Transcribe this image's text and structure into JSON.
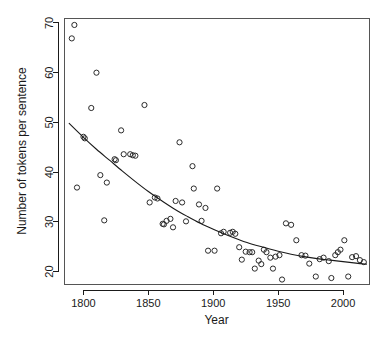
{
  "chart_data": {
    "type": "scatter",
    "title": "",
    "xlabel": "Year",
    "ylabel": "Number of tokens per sentence",
    "xlim": [
      1785,
      2020
    ],
    "ylim": [
      17.5,
      71
    ],
    "grid": false,
    "legend": "none",
    "xticks": [
      1800,
      1850,
      1900,
      1950,
      2000
    ],
    "yticks": [
      20,
      30,
      40,
      50,
      60,
      70
    ],
    "xtick_labels": [
      "1800",
      "1850",
      "1900",
      "1950",
      "2000"
    ],
    "ytick_labels": [
      "20",
      "30",
      "40",
      "50",
      "60",
      "70"
    ],
    "point_marker": "open-circle",
    "point_color": "#2b2b2b",
    "curve_color": "#1a1a1a",
    "series": [
      {
        "name": "tokens per sentence",
        "x": [
          1791,
          1793,
          1795,
          1800,
          1801,
          1806,
          1810,
          1813,
          1816,
          1818,
          1824,
          1825,
          1829,
          1831,
          1836,
          1838,
          1840,
          1847,
          1851,
          1855,
          1857,
          1861,
          1862,
          1864,
          1867,
          1869,
          1871,
          1874,
          1876,
          1879,
          1884,
          1885,
          1889,
          1891,
          1894,
          1896,
          1901,
          1903,
          1906,
          1908,
          1913,
          1915,
          1917,
          1920,
          1922,
          1925,
          1928,
          1930,
          1932,
          1935,
          1937,
          1939,
          1941,
          1944,
          1946,
          1948,
          1951,
          1953,
          1956,
          1960,
          1964,
          1968,
          1971,
          1974,
          1979,
          1982,
          1985,
          1989,
          1991,
          1994,
          1996,
          1998,
          2001,
          2004,
          2007,
          2010,
          2013,
          2016
        ],
        "y": [
          66.9,
          69.6,
          36.9,
          47.1,
          46.8,
          52.9,
          60.0,
          39.4,
          30.3,
          37.9,
          42.6,
          42.4,
          48.4,
          43.6,
          43.6,
          43.4,
          43.3,
          53.5,
          33.9,
          34.9,
          34.7,
          29.6,
          29.5,
          30.2,
          30.6,
          28.9,
          34.2,
          46.0,
          33.9,
          30.1,
          41.2,
          36.7,
          33.5,
          30.2,
          32.8,
          24.2,
          24.2,
          36.7,
          27.7,
          28.0,
          27.8,
          28.0,
          27.6,
          24.9,
          22.4,
          24.0,
          23.9,
          23.9,
          20.6,
          22.2,
          21.5,
          24.4,
          23.9,
          22.8,
          20.6,
          23.0,
          23.3,
          18.4,
          29.7,
          29.4,
          26.3,
          23.3,
          23.2,
          21.6,
          19.0,
          22.5,
          22.8,
          22.1,
          18.7,
          23.3,
          23.9,
          24.4,
          26.3,
          19.0,
          22.9,
          23.1,
          22.3,
          21.9
        ]
      }
    ],
    "trend": {
      "name": "fitted smooth curve",
      "x": [
        1789,
        1800,
        1810,
        1820,
        1830,
        1840,
        1850,
        1860,
        1870,
        1880,
        1890,
        1900,
        1910,
        1920,
        1930,
        1940,
        1950,
        1960,
        1970,
        1980,
        1990,
        2000,
        2010,
        2018
      ],
      "y": [
        49.8,
        47.0,
        44.6,
        42.4,
        40.2,
        38.1,
        36.1,
        34.3,
        32.6,
        31.1,
        29.7,
        28.5,
        27.4,
        26.4,
        25.5,
        24.8,
        24.1,
        23.5,
        23.0,
        22.6,
        22.3,
        22.0,
        21.7,
        21.5
      ]
    }
  }
}
